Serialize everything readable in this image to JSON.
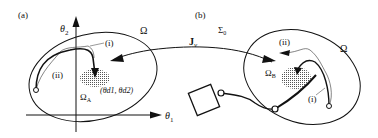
{
  "panel_a": {
    "label": "(a)",
    "axis_y": "θ",
    "axis_y_sub": "2",
    "axis_x": "θ",
    "axis_x_sub": "1",
    "region": "Ω",
    "path_i": "(i)",
    "path_ii": "(ii)",
    "target_region": "Ω",
    "target_region_sub": "A",
    "target_point": "(θd1, θd2)"
  },
  "panel_b": {
    "label": "(b)",
    "sigma": "Σ",
    "sigma_sub": "0",
    "jacobian": "J",
    "jacobian_sub": "v",
    "region": "Ω",
    "path_i": "(i)",
    "path_ii": "(ii)",
    "target_region": "Ω",
    "target_region_sub": "B"
  },
  "colors": {
    "stroke": "#111111",
    "stipple": "#555555",
    "background": "#ffffff"
  }
}
